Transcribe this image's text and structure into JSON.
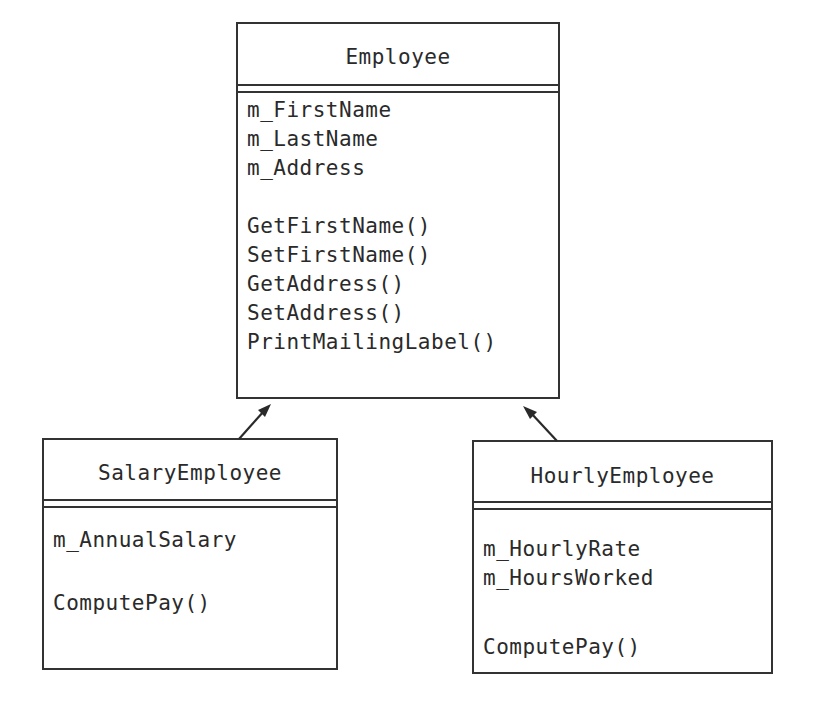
{
  "diagram": {
    "type": "UML class diagram (inheritance)",
    "classes": [
      {
        "id": "employee",
        "name": "Employee",
        "attributes": [
          "m_FirstName",
          "m_LastName",
          "m_Address"
        ],
        "methods": [
          "GetFirstName()",
          "SetFirstName()",
          "GetAddress()",
          "SetAddress()",
          "PrintMailingLabel()"
        ]
      },
      {
        "id": "salary-employee",
        "name": "SalaryEmployee",
        "attributes": [
          "m_AnnualSalary"
        ],
        "methods": [
          "ComputePay()"
        ]
      },
      {
        "id": "hourly-employee",
        "name": "HourlyEmployee",
        "attributes": [
          "m_HourlyRate",
          "m_HoursWorked"
        ],
        "methods": [
          "ComputePay()"
        ]
      }
    ],
    "relationships": [
      {
        "from": "SalaryEmployee",
        "to": "Employee",
        "type": "inherits"
      },
      {
        "from": "HourlyEmployee",
        "to": "Employee",
        "type": "inherits"
      }
    ],
    "colors": {
      "line": "#333333",
      "text": "#2a2a2a",
      "background": "#ffffff"
    }
  }
}
